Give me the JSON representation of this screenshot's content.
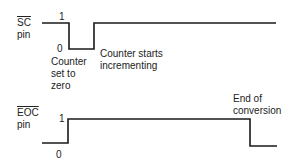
{
  "diagram": {
    "type": "timing-diagram",
    "signals": [
      {
        "name": "SC",
        "overline": true,
        "suffix": "pin",
        "level_high": "1",
        "level_low": "0",
        "annotations": [
          {
            "line1": "Counter",
            "line2": "set to",
            "line3": "zero"
          },
          {
            "line1": "Counter starts",
            "line2": "incrementing"
          }
        ]
      },
      {
        "name": "EOC",
        "overline": true,
        "suffix": "pin",
        "level_high": "1",
        "level_low": "0",
        "annotations": [
          {
            "line1": "End of",
            "line2": "conversion"
          }
        ]
      }
    ]
  },
  "colors": {
    "line": "#1a1a1a",
    "text": "#222222"
  }
}
